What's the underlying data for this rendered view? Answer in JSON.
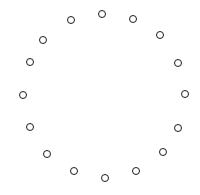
{
  "diagram": {
    "type": "circle-of-rings",
    "stroke_color": "#1c1c1c",
    "background": "#ffffff",
    "ring_diameter_px": 9,
    "count": 16,
    "points": [
      {
        "x": 102,
        "y": 14
      },
      {
        "x": 133,
        "y": 19
      },
      {
        "x": 160,
        "y": 35
      },
      {
        "x": 178,
        "y": 63
      },
      {
        "x": 185,
        "y": 94
      },
      {
        "x": 178,
        "y": 128
      },
      {
        "x": 163,
        "y": 152
      },
      {
        "x": 136,
        "y": 171
      },
      {
        "x": 105,
        "y": 178
      },
      {
        "x": 74,
        "y": 171
      },
      {
        "x": 47,
        "y": 154
      },
      {
        "x": 30,
        "y": 127
      },
      {
        "x": 23,
        "y": 95
      },
      {
        "x": 30,
        "y": 62
      },
      {
        "x": 43,
        "y": 40
      },
      {
        "x": 71,
        "y": 20
      }
    ]
  }
}
